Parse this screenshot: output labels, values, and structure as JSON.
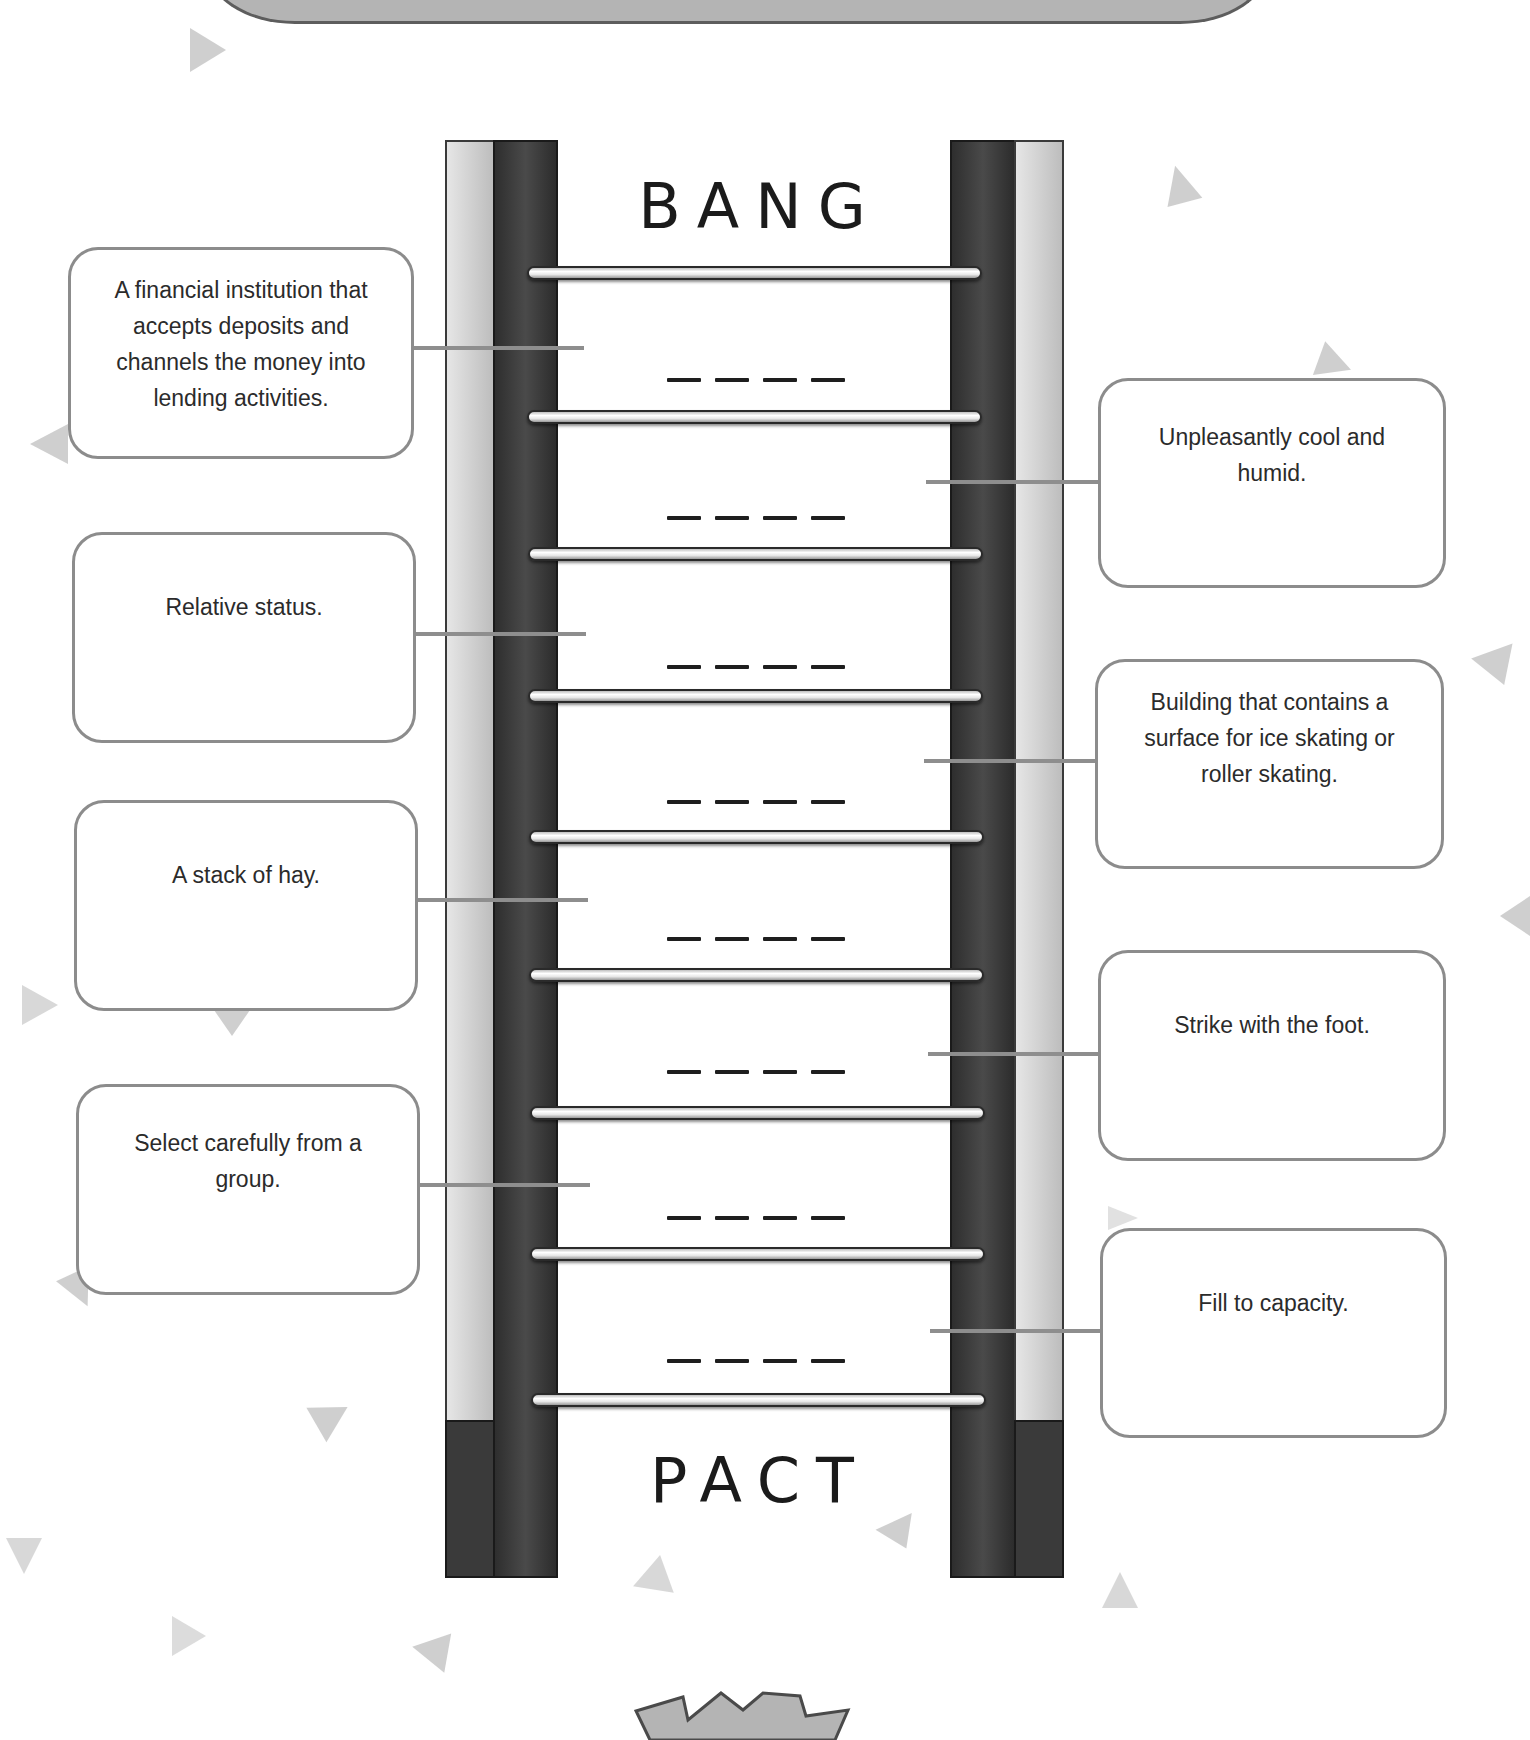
{
  "puzzle": {
    "type": "word-ladder",
    "start_word": "BANG",
    "end_word": "PACT",
    "blank_rows": 8,
    "blank_pattern": "_ _ _ _"
  },
  "clues": {
    "left": [
      {
        "text": "A financial institution that accepts deposits and channels the money into lending activities."
      },
      {
        "text": "Relative status."
      },
      {
        "text": "A stack of hay."
      },
      {
        "text": "Select carefully from a group."
      }
    ],
    "right": [
      {
        "text": "Unpleasantly cool and humid."
      },
      {
        "text": "Building that contains a surface for ice skating or roller skating."
      },
      {
        "text": "Strike with the foot."
      },
      {
        "text": "Fill to capacity."
      }
    ]
  },
  "colors": {
    "rail_dark": "#2e2e2e",
    "rail_light": "#d6d6d6",
    "box_border": "#8c8c8c",
    "header_fill": "#b4b4b4",
    "decor_triangle": "#a8a8a8"
  },
  "decorations": {
    "header_banner": "rounded-gray-banner",
    "footer_badge": "starburst"
  }
}
